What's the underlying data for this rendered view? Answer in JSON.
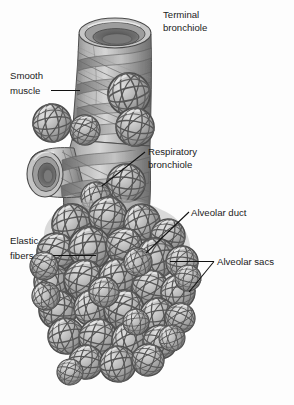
{
  "figure": {
    "background_color": "#fdfdfd",
    "ink_color": "#111111",
    "palette": {
      "outline": "#4a4a4a",
      "sphere_light": "#d2d2d2",
      "sphere_mid": "#a8a8a8",
      "sphere_dark": "#6f6f6f",
      "tube_light": "#c9c9c9",
      "tube_mid": "#9a9a9a",
      "tube_dark": "#5e5e5e",
      "lumen_dark": "#5a5a5a"
    }
  },
  "labels": [
    {
      "id": "terminal-bronchiole",
      "lines": [
        "Terminal",
        "bronchiole"
      ],
      "line1": "Terminal",
      "line2": "bronchiole",
      "text_x": 163,
      "text_y": 18,
      "anchor": "start",
      "leader": "none"
    },
    {
      "id": "smooth-muscle",
      "lines": [
        "Smooth",
        "muscle"
      ],
      "line1": "Smooth",
      "line2": "muscle",
      "text_x": 10,
      "text_y": 79,
      "anchor": "start",
      "leader": "horizontal"
    },
    {
      "id": "respiratory-bronchiole",
      "lines": [
        "Respiratory",
        "bronchiole"
      ],
      "line1": "Respiratory",
      "line2": "bronchiole",
      "text_x": 148,
      "text_y": 155,
      "anchor": "start",
      "leader": "diagonal-down-left"
    },
    {
      "id": "alveolar-duct",
      "lines": [
        "Alveolar duct"
      ],
      "line1": "Alveolar duct",
      "line2": "",
      "text_x": 191,
      "text_y": 216,
      "anchor": "start",
      "leader": "diagonal-down-left"
    },
    {
      "id": "elastic-fibers",
      "lines": [
        "Elastic",
        "fibers"
      ],
      "line1": "Elastic",
      "line2": "fibers",
      "text_x": 10,
      "text_y": 244,
      "anchor": "start",
      "leader": "horizontal"
    },
    {
      "id": "alveolar-sacs",
      "lines": [
        "Alveolar sacs"
      ],
      "line1": "Alveolar sacs",
      "line2": "",
      "text_x": 217,
      "text_y": 265,
      "anchor": "start",
      "leader": "forked"
    }
  ],
  "structures": [
    {
      "id": "terminal-bronchiole-tube",
      "name": "Terminal bronchiole",
      "description": "Cut-open tube at top with concentric lumen rings"
    },
    {
      "id": "smooth-muscle-bands",
      "name": "Smooth muscle",
      "description": "Crisscrossing spiral bands wrapping the bronchiole walls"
    },
    {
      "id": "side-branch-tube",
      "name": "Side branch bronchiole",
      "description": "Cut-open tube opening toward the left"
    },
    {
      "id": "respiratory-bronchiole-tube",
      "name": "Respiratory bronchiole",
      "description": "Lower tube bearing scattered alveoli"
    },
    {
      "id": "alveolar-duct-passage",
      "name": "Alveolar duct",
      "description": "Passage within the alveolar cluster"
    },
    {
      "id": "alveolar-sac-cluster",
      "name": "Alveolar sacs",
      "description": "Dense cluster of overlapping spherical alveoli"
    },
    {
      "id": "elastic-fiber-network",
      "name": "Elastic fibers",
      "description": "Great-circle banding lines over the alveoli"
    }
  ]
}
